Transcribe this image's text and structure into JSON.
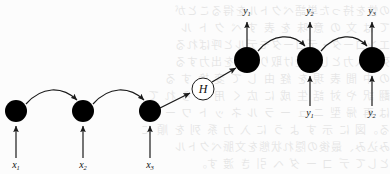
{
  "figure": {
    "type": "seq2seq-encoder-decoder-diagram",
    "title": "",
    "background_note": "scanned page with faint reversed bleed-through CJK text"
  },
  "bleed_text": {
    "lines": [
      "の性を持った単語ベクトルを得ることが",
      "て は 文 の 意 味 を 表 す ベ ク ト ル",
      "エンコーダ・デコーダモデルと呼ばれる",
      "列を入力として受け取り系列を出力する",
      "の 中 間 表 現 を 経 由 し て 変 換 す る",
      "翻 訳 や 対 話 生 成 に 広 く 用 い ら れ て",
      "は 再 帰 型 ニ ュ ー ラ ル ネ ッ ト ワ ー ク",
      "る。図 に 示 す よ う に 入 力 系 列 を 順 に",
      "み込み、最後の隠れ状態を文脈ベクトル",
      "として デ コ ー ダ へ 引 き 渡 す。"
    ]
  },
  "nodes": {
    "encoder": [
      {
        "id": "enc-1",
        "label": "",
        "cx": 16,
        "cy": 111,
        "r": 11,
        "fill": "#000000",
        "stroke": "#000000"
      },
      {
        "id": "enc-2",
        "label": "",
        "cx": 83,
        "cy": 111,
        "r": 11,
        "fill": "#000000",
        "stroke": "#000000"
      },
      {
        "id": "enc-3",
        "label": "",
        "cx": 150,
        "cy": 111,
        "r": 11,
        "fill": "#000000",
        "stroke": "#000000"
      }
    ],
    "context": {
      "id": "context-H",
      "label": "H",
      "cx": 203,
      "cy": 89,
      "r": 11,
      "fill": "#ffffff",
      "stroke": "#000000"
    },
    "decoder": [
      {
        "id": "dec-1",
        "label": "",
        "cx": 247,
        "cy": 60,
        "r": 13,
        "fill": "#000000",
        "stroke": "#000000"
      },
      {
        "id": "dec-2",
        "label": "",
        "cx": 310,
        "cy": 60,
        "r": 13,
        "fill": "#000000",
        "stroke": "#000000"
      },
      {
        "id": "dec-3",
        "label": "",
        "cx": 372,
        "cy": 60,
        "r": 13,
        "fill": "#000000",
        "stroke": "#000000"
      }
    ]
  },
  "labels": {
    "inputs": [
      {
        "id": "input-x1",
        "base": "x",
        "sub": "1",
        "x": 16,
        "y": 168
      },
      {
        "id": "input-x2",
        "base": "x",
        "sub": "2",
        "x": 83,
        "y": 168
      },
      {
        "id": "input-x3",
        "base": "x",
        "sub": "3",
        "x": 150,
        "y": 168
      }
    ],
    "outputs": [
      {
        "id": "output-y1",
        "base": "y",
        "sub": "1",
        "x": 247,
        "y": 14
      },
      {
        "id": "output-y2",
        "base": "y",
        "sub": "2",
        "x": 310,
        "y": 14
      },
      {
        "id": "output-y3",
        "base": "y",
        "sub": "3",
        "x": 372,
        "y": 14
      }
    ],
    "feedback": [
      {
        "id": "feedback-y1",
        "base": "y",
        "sub": "1",
        "x": 310,
        "y": 116
      },
      {
        "id": "feedback-y2",
        "base": "y",
        "sub": "2",
        "x": 372,
        "y": 116
      }
    ]
  },
  "colors": {
    "node_fill": "#000000",
    "context_fill": "#ffffff",
    "stroke": "#1a1a1a",
    "background": "#fcfcfc",
    "bleed": "#000000"
  },
  "caption": ""
}
